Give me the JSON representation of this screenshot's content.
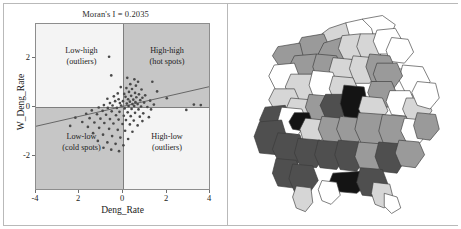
{
  "figure": {
    "panels": [
      "moran-scatterplot",
      "choropleth-map"
    ]
  },
  "scatter_panel": {
    "title": "Moran's I = 0.2035",
    "xlabel": "Deng_Rate",
    "ylabel": "W_Deng_Rate",
    "xticks": [
      "-4",
      "2",
      "0",
      "2",
      "4"
    ],
    "yticks": [
      "2",
      "0",
      "-2"
    ],
    "quadrants": [
      {
        "id": "low-high",
        "line1": "Low-high",
        "line2": "(outliers)",
        "shade": "#f4f4f4"
      },
      {
        "id": "high-high",
        "line1": "High-high",
        "line2": "(hot spots)",
        "shade": "#c6c6c6"
      },
      {
        "id": "low-low",
        "line1": "Low-low",
        "line2": "(cold spots)",
        "shade": "#c6c6c6"
      },
      {
        "id": "high-low",
        "line1": "High-low",
        "line2": "(outliers)",
        "shade": "#f4f4f4"
      }
    ]
  },
  "chart_data": {
    "type": "scatter",
    "title": "Moran's I = 0.2035",
    "xlabel": "Deng_Rate",
    "ylabel": "W_Deng_Rate",
    "xlim": [
      -4,
      4
    ],
    "ylim": [
      -3.4,
      3.4
    ],
    "xtick_values": [
      -4,
      -2,
      0,
      2,
      4
    ],
    "ytick_values": [
      2,
      0,
      -2
    ],
    "grid": false,
    "legend": null,
    "morans_i": 0.2035,
    "fit_line": {
      "slope": 0.2035,
      "intercept": 0.0,
      "x_from": -4,
      "x_to": 4
    },
    "annotations": [
      {
        "text": "Low-high (outliers)",
        "quadrant": "upper-left"
      },
      {
        "text": "High-high (hot spots)",
        "quadrant": "upper-right"
      },
      {
        "text": "Low-low (cold spots)",
        "quadrant": "lower-left"
      },
      {
        "text": "High-low (outliers)",
        "quadrant": "lower-right"
      }
    ],
    "points": [
      [
        -0.62,
        2.05
      ],
      [
        -0.52,
        1.28
      ],
      [
        0.22,
        1.18
      ],
      [
        0.55,
        1.12
      ],
      [
        0.72,
        1.02
      ],
      [
        1.38,
        1.02
      ],
      [
        0.36,
        0.92
      ],
      [
        0.62,
        0.86
      ],
      [
        -0.08,
        0.8
      ],
      [
        0.18,
        0.76
      ],
      [
        0.44,
        0.72
      ],
      [
        0.88,
        0.7
      ],
      [
        1.6,
        0.62
      ],
      [
        0.3,
        0.6
      ],
      [
        0.58,
        0.56
      ],
      [
        -0.22,
        0.54
      ],
      [
        0.08,
        0.52
      ],
      [
        0.76,
        0.5
      ],
      [
        1.05,
        0.46
      ],
      [
        0.4,
        0.44
      ],
      [
        -0.4,
        0.42
      ],
      [
        0.14,
        0.4
      ],
      [
        0.64,
        0.38
      ],
      [
        0.92,
        0.36
      ],
      [
        2.05,
        0.34
      ],
      [
        -0.7,
        0.32
      ],
      [
        -0.18,
        0.3
      ],
      [
        0.26,
        0.3
      ],
      [
        0.5,
        0.28
      ],
      [
        0.82,
        0.26
      ],
      [
        1.28,
        0.24
      ],
      [
        -0.34,
        0.22
      ],
      [
        0.02,
        0.22
      ],
      [
        0.34,
        0.2
      ],
      [
        0.6,
        0.18
      ],
      [
        1.0,
        0.16
      ],
      [
        -0.58,
        0.14
      ],
      [
        -0.12,
        0.14
      ],
      [
        0.2,
        0.12
      ],
      [
        0.46,
        0.1
      ],
      [
        0.7,
        0.1
      ],
      [
        1.45,
        0.08
      ],
      [
        3.3,
        0.08
      ],
      [
        3.62,
        0.06
      ],
      [
        -0.86,
        0.06
      ],
      [
        -0.46,
        0.04
      ],
      [
        -0.06,
        0.04
      ],
      [
        0.28,
        0.02
      ],
      [
        0.54,
        0.02
      ],
      [
        0.86,
        0.0
      ],
      [
        1.15,
        -0.02
      ],
      [
        -1.1,
        -0.04
      ],
      [
        -0.68,
        -0.06
      ],
      [
        -0.26,
        -0.06
      ],
      [
        0.1,
        -0.08
      ],
      [
        0.42,
        -0.1
      ],
      [
        0.74,
        -0.12
      ],
      [
        1.32,
        -0.12
      ],
      [
        2.95,
        -0.14
      ],
      [
        -1.42,
        -0.16
      ],
      [
        -0.92,
        -0.18
      ],
      [
        -0.5,
        -0.2
      ],
      [
        -0.14,
        -0.22
      ],
      [
        0.24,
        -0.24
      ],
      [
        0.58,
        -0.26
      ],
      [
        0.96,
        -0.28
      ],
      [
        -1.68,
        -0.3
      ],
      [
        -1.18,
        -0.32
      ],
      [
        -0.76,
        -0.34
      ],
      [
        -0.3,
        -0.36
      ],
      [
        0.06,
        -0.38
      ],
      [
        0.38,
        -0.4
      ],
      [
        0.8,
        -0.42
      ],
      [
        1.22,
        -0.44
      ],
      [
        -2.18,
        -0.46
      ],
      [
        -1.52,
        -0.48
      ],
      [
        -1.02,
        -0.5
      ],
      [
        -0.58,
        -0.52
      ],
      [
        -0.18,
        -0.54
      ],
      [
        0.16,
        -0.56
      ],
      [
        0.52,
        -0.58
      ],
      [
        0.92,
        -0.6
      ],
      [
        -1.86,
        -0.64
      ],
      [
        -1.3,
        -0.66
      ],
      [
        -0.84,
        -0.68
      ],
      [
        -0.42,
        -0.7
      ],
      [
        0.0,
        -0.72
      ],
      [
        0.34,
        -0.74
      ],
      [
        0.7,
        -0.78
      ],
      [
        -2.42,
        -0.8
      ],
      [
        -1.6,
        -0.84
      ],
      [
        -1.08,
        -0.88
      ],
      [
        -0.62,
        -0.92
      ],
      [
        -0.22,
        -0.96
      ],
      [
        0.12,
        -1.0
      ],
      [
        0.46,
        -1.04
      ],
      [
        -1.36,
        -1.1
      ],
      [
        -0.9,
        -1.16
      ],
      [
        -0.48,
        -1.22
      ],
      [
        -0.1,
        -1.28
      ],
      [
        0.26,
        -1.34
      ],
      [
        -1.14,
        -1.42
      ],
      [
        -0.7,
        -1.48
      ],
      [
        -0.32,
        -1.54
      ],
      [
        0.04,
        -1.6
      ],
      [
        -0.88,
        -1.7
      ],
      [
        -0.52,
        -1.78
      ],
      [
        -0.16,
        -1.84
      ]
    ]
  },
  "map_panel": {
    "description": "Thailand province choropleth, grayscale shading",
    "colors": {
      "white": "#ffffff",
      "light": "#d6d6d6",
      "medium": "#9a9a9a",
      "dark": "#4f4f4f",
      "black": "#141414",
      "border": "#3a3a3a"
    },
    "regions": [
      {
        "id": "r01",
        "fill": "white",
        "points": "118,14 136,10 150,18 146,30 128,34 114,26"
      },
      {
        "id": "r02",
        "fill": "white",
        "points": "136,10 158,6 172,16 166,30 150,34 146,20"
      },
      {
        "id": "r03",
        "fill": "light",
        "points": "100,20 118,14 122,28 110,40 94,36 92,26"
      },
      {
        "id": "r04",
        "fill": "medium",
        "points": "70,30 94,26 100,40 90,56 72,54 64,42"
      },
      {
        "id": "r05",
        "fill": "medium",
        "points": "94,36 114,30 122,44 112,58 96,58 88,48"
      },
      {
        "id": "r06",
        "fill": "light",
        "points": "114,28 134,26 142,40 132,54 116,54 110,42"
      },
      {
        "id": "r07",
        "fill": "light",
        "points": "134,26 154,26 162,40 152,54 136,54 130,40"
      },
      {
        "id": "r08",
        "fill": "white",
        "points": "152,22 172,20 180,34 170,48 154,48 148,34"
      },
      {
        "id": "r09",
        "fill": "white",
        "points": "168,30 186,32 192,46 182,58 166,56 162,44"
      },
      {
        "id": "r10",
        "fill": "medium",
        "points": "44,40 68,36 72,52 62,66 46,62 38,50"
      },
      {
        "id": "r11",
        "fill": "medium",
        "points": "62,50 86,48 92,64 82,78 64,76 56,62"
      },
      {
        "id": "r12",
        "fill": "medium",
        "points": "86,48 108,50 114,64 104,78 88,78 82,62"
      },
      {
        "id": "r13",
        "fill": "light",
        "points": "104,52 126,54 132,68 122,82 106,80 100,66"
      },
      {
        "id": "r14",
        "fill": "light",
        "points": "126,50 148,52 154,66 144,80 128,80 122,64"
      },
      {
        "id": "r15",
        "fill": "medium",
        "points": "144,48 166,50 172,64 162,78 146,78 140,62"
      },
      {
        "id": "r16",
        "fill": "white",
        "points": "40,60 62,58 68,74 58,90 42,88 34,72"
      },
      {
        "id": "r17",
        "fill": "light",
        "points": "58,70 82,70 88,86 78,102 60,100 52,84"
      },
      {
        "id": "r18",
        "fill": "white",
        "points": "82,66 104,68 110,84 100,100 84,98 78,82"
      },
      {
        "id": "r19",
        "fill": "light",
        "points": "104,72 126,74 132,88 122,102 106,100 100,86"
      },
      {
        "id": "r20",
        "fill": "white",
        "points": "158,66 182,64 190,78 182,94 164,94 154,80"
      },
      {
        "id": "r21",
        "fill": "white",
        "points": "180,60 202,62 210,78 200,94 184,92 176,76"
      },
      {
        "id": "r22",
        "fill": "medium",
        "points": "152,58 174,58 180,72 170,86 154,84 148,70"
      },
      {
        "id": "r23",
        "fill": "medium",
        "points": "146,78 168,78 174,92 164,106 148,104 142,90"
      },
      {
        "id": "r24",
        "fill": "white",
        "points": "166,88 188,88 194,102 184,116 168,114 162,100"
      },
      {
        "id": "r25",
        "fill": "light",
        "points": "184,96 206,96 212,110 202,124 186,122 180,108"
      },
      {
        "id": "r26",
        "fill": "white",
        "points": "196,78 216,80 220,96 210,108 196,104 190,90"
      },
      {
        "id": "r27",
        "fill": "light",
        "points": "40,86 62,86 68,100 58,114 42,112 34,98"
      },
      {
        "id": "r28",
        "fill": "light",
        "points": "58,96 80,98 86,112 76,126 60,124 52,110"
      },
      {
        "id": "r29",
        "fill": "medium",
        "points": "78,92 100,94 106,108 96,122 80,120 74,106"
      },
      {
        "id": "r30",
        "fill": "dark",
        "points": "96,92 116,92 122,106 112,120 96,118 90,104"
      },
      {
        "id": "r31",
        "fill": "black",
        "points": "116,82 138,84 142,104 134,124 118,122 112,102"
      },
      {
        "id": "r32",
        "fill": "light",
        "points": "136,94 158,96 164,110 154,124 138,122 132,108"
      },
      {
        "id": "r33",
        "fill": "dark",
        "points": "30,106 52,104 58,120 48,136 30,134 24,120"
      },
      {
        "id": "r34",
        "fill": "white",
        "points": "48,106 70,108 76,122 66,136 50,134 44,120"
      },
      {
        "id": "r35",
        "fill": "black",
        "points": "62,112 78,112 82,124 72,132 60,130 56,122"
      },
      {
        "id": "r36",
        "fill": "light",
        "points": "74,118 94,120 98,134 88,146 72,144 68,130"
      },
      {
        "id": "r37",
        "fill": "medium",
        "points": "92,116 114,118 120,132 110,146 94,144 88,130"
      },
      {
        "id": "r38",
        "fill": "medium",
        "points": "112,116 134,118 140,132 130,146 114,144 108,130"
      },
      {
        "id": "r39",
        "fill": "medium",
        "points": "132,112 160,114 168,132 158,150 136,148 128,130"
      },
      {
        "id": "r40",
        "fill": "medium",
        "points": "158,114 184,116 190,134 180,150 160,148 154,132"
      },
      {
        "id": "r41",
        "fill": "white",
        "points": "182,118 202,120 208,134 198,146 184,144 178,132"
      },
      {
        "id": "r42",
        "fill": "medium",
        "points": "196,112 216,114 220,130 210,142 196,140 192,126"
      },
      {
        "id": "r43",
        "fill": "dark",
        "points": "24,122 48,120 54,140 44,158 24,156 18,138"
      },
      {
        "id": "r44",
        "fill": "dark",
        "points": "44,134 68,136 74,154 64,170 46,168 38,152"
      },
      {
        "id": "r45",
        "fill": "dark",
        "points": "66,140 90,142 96,158 86,172 68,170 62,156"
      },
      {
        "id": "r46",
        "fill": "dark",
        "points": "88,142 112,144 118,160 108,174 90,172 84,158"
      },
      {
        "id": "r47",
        "fill": "dark",
        "points": "110,142 134,144 140,160 130,176 112,174 106,158"
      },
      {
        "id": "r48",
        "fill": "medium",
        "points": "132,144 156,146 162,162 152,176 134,174 128,160"
      },
      {
        "id": "r49",
        "fill": "dark",
        "points": "154,144 178,146 184,162 174,178 156,176 150,160"
      },
      {
        "id": "r50",
        "fill": "medium",
        "points": "176,142 198,144 204,158 194,172 178,170 172,156"
      },
      {
        "id": "r51",
        "fill": "dark",
        "points": "42,162 64,164 70,180 60,194 44,192 38,178"
      },
      {
        "id": "r52",
        "fill": "dark",
        "points": "60,168 82,170 88,186 78,200 62,198 56,184"
      },
      {
        "id": "r53",
        "fill": "light",
        "points": "64,192 80,194 82,210 74,220 64,216 60,204"
      },
      {
        "id": "r54",
        "fill": "black",
        "points": "104,178 134,176 142,190 130,200 108,198 100,188"
      },
      {
        "id": "r55",
        "fill": "dark",
        "points": "134,172 158,174 164,190 154,204 136,202 130,188"
      },
      {
        "id": "r56",
        "fill": "light",
        "points": "148,188 166,190 170,206 160,216 150,212 146,200"
      },
      {
        "id": "r57",
        "fill": "white",
        "points": "92,186 108,188 112,202 102,212 92,208 88,196"
      },
      {
        "id": "r58",
        "fill": "white",
        "points": "160,200 174,204 178,216 168,222 160,214"
      }
    ]
  }
}
